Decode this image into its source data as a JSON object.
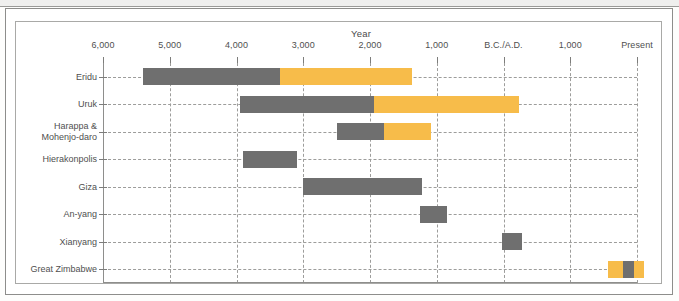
{
  "chart_data": {
    "type": "bar",
    "title": "Year",
    "xlabel": "Year",
    "ylabel": "",
    "grid": true,
    "legend_position": "none",
    "orientation": "horizontal",
    "axis": {
      "tick_labels": [
        "6,000",
        "5,000",
        "4,000",
        "3,000",
        "2,000",
        "1,000",
        "B.C./A.D.",
        "1,000",
        "Present"
      ],
      "tick_values": [
        -6000,
        -5000,
        -4000,
        -3000,
        -2000,
        -1000,
        0,
        1000,
        2000
      ],
      "xlim": [
        -6500,
        2500
      ],
      "note": "Years B.C. to the left of B.C./A.D., years A.D. to the right"
    },
    "colors": {
      "gray": "#6f6f6f",
      "yellow": "#f7bc4a",
      "axis": "#8e8e8c",
      "grid": "#9d9d9b",
      "text": "#4f4f4f"
    },
    "categories": [
      "Eridu",
      "Uruk",
      "Harappa &\nMohenjo-daro",
      "Hierakonpolis",
      "Giza",
      "An-yang",
      "Xianyang",
      "Great Zimbabwe"
    ],
    "series": [
      {
        "name": "Eridu",
        "segments": [
          {
            "color": "gray",
            "start": -5400,
            "end": -3350
          },
          {
            "color": "yellow",
            "start": -3350,
            "end": -1370
          }
        ]
      },
      {
        "name": "Uruk",
        "segments": [
          {
            "color": "gray",
            "start": -3950,
            "end": -1940
          },
          {
            "color": "yellow",
            "start": -1940,
            "end": 230
          }
        ]
      },
      {
        "name": "Harappa & Mohenjo-daro",
        "segments": [
          {
            "color": "gray",
            "start": -2500,
            "end": -1790
          },
          {
            "color": "yellow",
            "start": -1790,
            "end": -1090
          }
        ]
      },
      {
        "name": "Hierakonpolis",
        "segments": [
          {
            "color": "gray",
            "start": -3900,
            "end": -3090
          }
        ]
      },
      {
        "name": "Giza",
        "segments": [
          {
            "color": "gray",
            "start": -3000,
            "end": -1220
          }
        ]
      },
      {
        "name": "An-yang",
        "segments": [
          {
            "color": "gray",
            "start": -1250,
            "end": -840
          }
        ]
      },
      {
        "name": "Xianyang",
        "segments": [
          {
            "color": "gray",
            "start": -20,
            "end": 270
          }
        ]
      },
      {
        "name": "Great Zimbabwe",
        "segments": [
          {
            "color": "yellow",
            "start": 1560,
            "end": 1790
          },
          {
            "color": "gray",
            "start": 1790,
            "end": 1950
          },
          {
            "color": "yellow",
            "start": 1950,
            "end": 2110
          }
        ]
      }
    ]
  }
}
